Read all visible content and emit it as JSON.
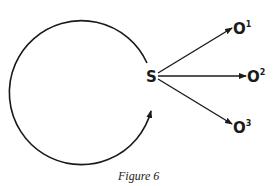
{
  "diagram": {
    "source_node": {
      "label": "S"
    },
    "outcome_nodes": [
      {
        "label": "O",
        "superscript": "1"
      },
      {
        "label": "O",
        "superscript": "2"
      },
      {
        "label": "O",
        "superscript": "3"
      }
    ],
    "loop": {
      "description": "circular arrow returning to S"
    },
    "caption": "Figure 6",
    "colors": {
      "ink": "#1a1a1a",
      "background": "#ffffff"
    }
  }
}
